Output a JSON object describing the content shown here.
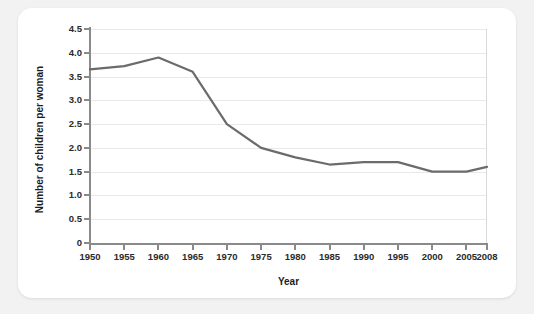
{
  "chart_data": {
    "type": "line",
    "title": "",
    "xlabel": "Year",
    "ylabel": "Number of children per woman",
    "xlim": [
      1950,
      2008
    ],
    "ylim": [
      0,
      4.5
    ],
    "grid": true,
    "legend": "none",
    "line_color": "#6b6b6b",
    "x_ticks": [
      "1950",
      "1955",
      "1960",
      "1965",
      "1970",
      "1975",
      "1980",
      "1985",
      "1990",
      "1995",
      "2000",
      "2005",
      "2008"
    ],
    "x_tick_values": [
      1950,
      1955,
      1960,
      1965,
      1970,
      1975,
      1980,
      1985,
      1990,
      1995,
      2000,
      2005,
      2008
    ],
    "y_ticks": [
      "0",
      "0.5",
      "1.0",
      "1.5",
      "2.0",
      "2.5",
      "3.0",
      "3.5",
      "4.0",
      "4.5"
    ],
    "y_tick_values": [
      0,
      0.5,
      1.0,
      1.5,
      2.0,
      2.5,
      3.0,
      3.5,
      4.0,
      4.5
    ],
    "x": [
      1950,
      1955,
      1960,
      1965,
      1970,
      1975,
      1980,
      1985,
      1990,
      1995,
      2000,
      2005,
      2008
    ],
    "values": [
      3.65,
      3.72,
      3.9,
      3.6,
      2.5,
      2.0,
      1.8,
      1.65,
      1.7,
      1.7,
      1.5,
      1.5,
      1.6
    ],
    "series": [
      {
        "name": "Number of children per woman",
        "values": [
          3.65,
          3.72,
          3.9,
          3.6,
          2.5,
          2.0,
          1.8,
          1.65,
          1.7,
          1.7,
          1.5,
          1.5,
          1.6
        ]
      }
    ]
  },
  "axes": {
    "x_title": "Year",
    "y_title": "Number of children per woman"
  },
  "colors": {
    "page_background": "#f2f2f2",
    "card_background": "#ffffff",
    "line": "#6b6b6b",
    "axis": "#8a8a8a",
    "gridline": "#e9e9e9",
    "text": "#1c1c1c"
  }
}
